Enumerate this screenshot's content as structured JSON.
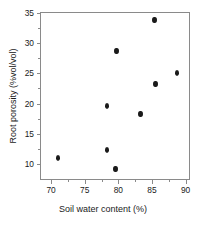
{
  "chart_data": {
    "type": "scatter",
    "title": "",
    "xlabel": "Soil water content (%)",
    "ylabel": "Root porosity (%vol/vol)",
    "xlim": [
      68.5,
      90.5
    ],
    "ylim": [
      7.5,
      35
    ],
    "xticks": [
      70,
      75,
      80,
      85,
      90
    ],
    "yticks": [
      10,
      15,
      20,
      25,
      30,
      35
    ],
    "xticklabels": [
      "70",
      "75",
      "80",
      "85",
      "90"
    ],
    "yticklabels": [
      "10",
      "15",
      "20",
      "25",
      "30",
      "35"
    ],
    "x_minor_ticks": [
      72.5,
      77.5,
      82.5,
      87.5
    ],
    "y_minor_ticks": [
      12.5,
      17.5,
      22.5,
      27.5,
      32.5
    ],
    "grid": false,
    "legend": null,
    "marker": "filled-circle",
    "marker_color": "#1a1a1a",
    "axis_color": "#8a8a8a",
    "series": [
      {
        "name": "Root porosity vs soil water content",
        "points": [
          {
            "x": 71.0,
            "y": 11.0
          },
          {
            "x": 78.3,
            "y": 19.6
          },
          {
            "x": 78.3,
            "y": 12.3
          },
          {
            "x": 79.6,
            "y": 9.1
          },
          {
            "x": 79.7,
            "y": 28.7
          },
          {
            "x": 83.3,
            "y": 18.3
          },
          {
            "x": 85.4,
            "y": 33.9
          },
          {
            "x": 85.5,
            "y": 23.2
          },
          {
            "x": 88.7,
            "y": 25.0
          }
        ]
      }
    ]
  }
}
